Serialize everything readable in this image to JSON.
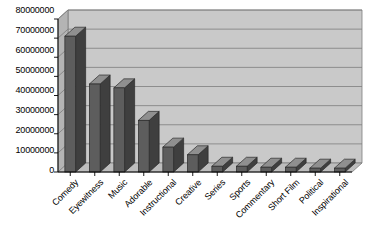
{
  "chart_data": {
    "type": "bar",
    "title": "",
    "subtitle": "",
    "xlabel": "",
    "ylabel": "",
    "categories": [
      "Comedy",
      "Eyewitness",
      "Music",
      "Adorable",
      "Instructional",
      "Creative",
      "Series",
      "Sports",
      "Commentary",
      "Short Film",
      "Political",
      "Inspirational"
    ],
    "values": [
      71000000,
      46000000,
      44000000,
      27000000,
      13000000,
      9000000,
      3000000,
      3000000,
      2500000,
      2500000,
      2000000,
      2000000
    ],
    "ylim": [
      0,
      80000000
    ],
    "ytick_values": [
      0,
      10000000,
      20000000,
      30000000,
      40000000,
      50000000,
      60000000,
      70000000,
      80000000
    ],
    "ytick_labels": [
      "0",
      "10000000",
      "20000000",
      "30000000",
      "40000000",
      "50000000",
      "60000000",
      "70000000",
      "80000000"
    ],
    "grid": true,
    "grid_axis": "y",
    "legend": false,
    "legend_position": "none",
    "style": "3d-column",
    "colors": {
      "bar_front": "#5d5d5d",
      "bar_top": "#8f8f8f",
      "bar_side": "#3f3f3f",
      "plot_back": "#c9c9c9",
      "plot_floor": "#bdbdbd",
      "plot_side": "#b4b4b4",
      "grid_line": "#7d7d7d",
      "axis_line": "#000000",
      "text": "#000000",
      "background": "#ffffff"
    }
  }
}
